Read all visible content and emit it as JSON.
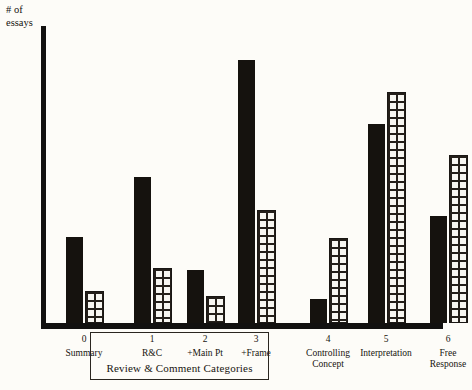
{
  "chart_data": {
    "type": "bar",
    "title": "",
    "subtitle": "",
    "ylabel": "# of essays",
    "xlabel": "Review & Comment  Categories",
    "ylim": [
      0,
      10
    ],
    "yticks": [
      1,
      2,
      3,
      4,
      5,
      6,
      7,
      8,
      9,
      10
    ],
    "grid": false,
    "legend": "none",
    "categories": [
      "0",
      "1",
      "2",
      "3",
      "4",
      "5",
      "6"
    ],
    "category_names": [
      "Summary",
      "R&C",
      "+Main Pt",
      "+Frame",
      "Controlling Concept",
      "Interpretation",
      "Free Response"
    ],
    "series": [
      {
        "name": "solid",
        "pattern": "solid-black",
        "values": [
          2.9,
          4.9,
          1.8,
          8.85,
          0.8,
          6.7,
          3.6
        ]
      },
      {
        "name": "hatched",
        "pattern": "brick-hatch",
        "values": [
          1.0,
          1.8,
          0.85,
          3.75,
          2.8,
          7.7,
          5.6
        ]
      }
    ],
    "annotations": [
      {
        "text": "Review & Comment  Categories",
        "encloses": [
          "1",
          "2",
          "3"
        ],
        "style": "boxed-bracket"
      }
    ]
  },
  "axis": {
    "y_title_line1": "# of",
    "y_title_line2": "essays"
  },
  "xaxis": {
    "labels": [
      {
        "num": "0",
        "name": "Summary",
        "name2": ""
      },
      {
        "num": "1",
        "name": "R&C",
        "name2": ""
      },
      {
        "num": "2",
        "name": "+Main  Pt",
        "name2": ""
      },
      {
        "num": "3",
        "name": "+Frame",
        "name2": ""
      },
      {
        "num": "4",
        "name": "Controlling",
        "name2": "Concept"
      },
      {
        "num": "5",
        "name": "Interpretation",
        "name2": ""
      },
      {
        "num": "6",
        "name": "Free",
        "name2": "Response"
      }
    ],
    "group_caption": "Review & Comment  Categories"
  },
  "colors": {
    "ink": "#15120e",
    "paper": "#fdfcf8"
  }
}
